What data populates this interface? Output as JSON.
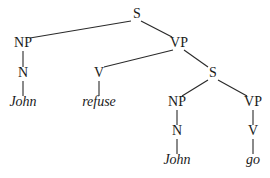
{
  "diagram": {
    "type": "syntax-tree",
    "nodes": [
      {
        "id": "s1",
        "label": "S",
        "x": 137,
        "y": 15,
        "leaf": false
      },
      {
        "id": "np1",
        "label": "NP",
        "x": 23,
        "y": 44,
        "leaf": false
      },
      {
        "id": "vp1",
        "label": "VP",
        "x": 179,
        "y": 44,
        "leaf": false
      },
      {
        "id": "n1",
        "label": "N",
        "x": 23,
        "y": 74,
        "leaf": false
      },
      {
        "id": "v1",
        "label": "V",
        "x": 99,
        "y": 74,
        "leaf": false
      },
      {
        "id": "s2",
        "label": "S",
        "x": 213,
        "y": 74,
        "leaf": false
      },
      {
        "id": "john1",
        "label": "John",
        "x": 23,
        "y": 103,
        "leaf": true
      },
      {
        "id": "refuse",
        "label": "refuse",
        "x": 99,
        "y": 103,
        "leaf": true
      },
      {
        "id": "np2",
        "label": "NP",
        "x": 177,
        "y": 103,
        "leaf": false
      },
      {
        "id": "vp2",
        "label": "VP",
        "x": 253,
        "y": 103,
        "leaf": false
      },
      {
        "id": "n2",
        "label": "N",
        "x": 177,
        "y": 132,
        "leaf": false
      },
      {
        "id": "v2",
        "label": "V",
        "x": 253,
        "y": 132,
        "leaf": false
      },
      {
        "id": "john2",
        "label": "John",
        "x": 177,
        "y": 161,
        "leaf": true
      },
      {
        "id": "go",
        "label": "go",
        "x": 253,
        "y": 161,
        "leaf": true
      }
    ],
    "edges": [
      {
        "from": "s1",
        "to": "np1",
        "x1": 131,
        "y1": 21,
        "x2": 30,
        "y2": 38
      },
      {
        "from": "s1",
        "to": "vp1",
        "x1": 141,
        "y1": 21,
        "x2": 172,
        "y2": 37
      },
      {
        "from": "np1",
        "to": "n1",
        "x1": 23,
        "y1": 51,
        "x2": 23,
        "y2": 67
      },
      {
        "from": "vp1",
        "to": "v1",
        "x1": 173,
        "y1": 50,
        "x2": 104,
        "y2": 67
      },
      {
        "from": "vp1",
        "to": "s2",
        "x1": 184,
        "y1": 50,
        "x2": 208,
        "y2": 67
      },
      {
        "from": "n1",
        "to": "john1",
        "x1": 23,
        "y1": 81,
        "x2": 23,
        "y2": 96
      },
      {
        "from": "v1",
        "to": "refuse",
        "x1": 99,
        "y1": 81,
        "x2": 99,
        "y2": 96
      },
      {
        "from": "s2",
        "to": "np2",
        "x1": 208,
        "y1": 80,
        "x2": 182,
        "y2": 96
      },
      {
        "from": "s2",
        "to": "vp2",
        "x1": 218,
        "y1": 80,
        "x2": 247,
        "y2": 96
      },
      {
        "from": "np2",
        "to": "n2",
        "x1": 177,
        "y1": 110,
        "x2": 177,
        "y2": 125
      },
      {
        "from": "vp2",
        "to": "v2",
        "x1": 253,
        "y1": 110,
        "x2": 253,
        "y2": 125
      },
      {
        "from": "n2",
        "to": "john2",
        "x1": 177,
        "y1": 139,
        "x2": 177,
        "y2": 154
      },
      {
        "from": "v2",
        "to": "go",
        "x1": 253,
        "y1": 139,
        "x2": 253,
        "y2": 154
      }
    ]
  },
  "colors": {
    "background": "#ffffff",
    "line": "#2a2a2a",
    "text": "#1a1a1a"
  }
}
